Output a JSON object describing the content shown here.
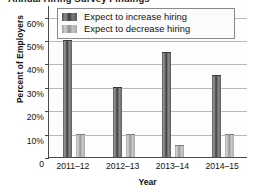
{
  "chart_data": {
    "type": "bar",
    "title": "Annual Hiring Survey Findings",
    "xlabel": "Year",
    "ylabel": "Percent of Employers",
    "categories": [
      "2011–12",
      "2012–13",
      "2013–14",
      "2014–15"
    ],
    "series": [
      {
        "name": "Expect to increase hiring",
        "values": [
          50,
          30,
          45,
          35
        ],
        "color": "#4f4f4f"
      },
      {
        "name": "Expect to decrease hiring",
        "values": [
          10,
          10,
          5,
          10
        ],
        "color": "#b0b0b0"
      }
    ],
    "ylim": [
      0,
      65
    ],
    "yticks": [
      "0",
      "10%",
      "20%",
      "30%",
      "40%",
      "50%",
      "60%"
    ],
    "ytick_values": [
      0,
      10,
      20,
      30,
      40,
      50,
      60
    ],
    "grid": true,
    "legend_position": "top-inside"
  }
}
